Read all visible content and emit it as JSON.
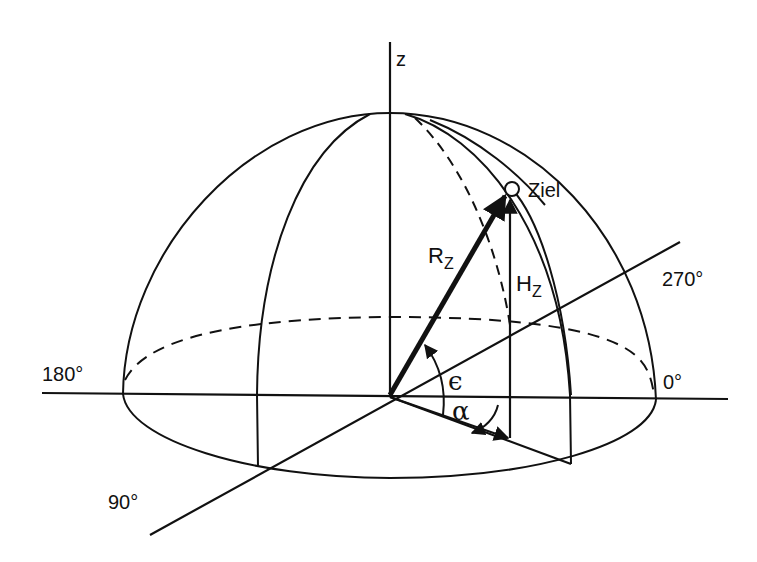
{
  "diagram": {
    "type": "hemisphere-coordinate-system",
    "axes": {
      "z_label": "z",
      "azimuth_labels": {
        "deg0": "0°",
        "deg90": "90°",
        "deg180": "180°",
        "deg270": "270°"
      }
    },
    "target": {
      "label": "Ziel"
    },
    "vectors": {
      "range_label_main": "R",
      "range_label_sub": "Z",
      "height_label_main": "H",
      "height_label_sub": "Z"
    },
    "angles": {
      "elevation": "ϵ",
      "azimuth": "α"
    },
    "colors": {
      "stroke": "#111111",
      "background": "#ffffff"
    }
  }
}
